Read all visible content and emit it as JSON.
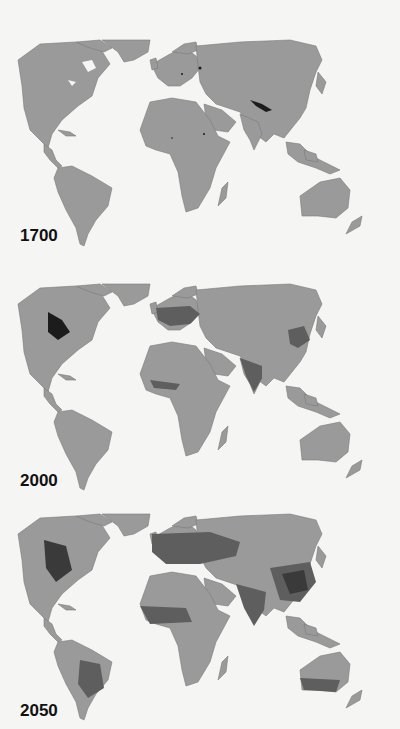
{
  "panels": [
    {
      "year": "1700",
      "top": 38,
      "label_top": 225,
      "intensity": "low"
    },
    {
      "year": "2000",
      "top": 282,
      "label_top": 470,
      "intensity": "medium"
    },
    {
      "year": "2050",
      "top": 512,
      "label_top": 700,
      "intensity": "high"
    }
  ],
  "colors": {
    "background": "#f5f5f3",
    "land": "#9a9a9a",
    "land_shadow": "#6e6e6e",
    "use_medium": "#5e5e5e",
    "use_high": "#3a3a3a",
    "use_max": "#1c1c1c"
  }
}
